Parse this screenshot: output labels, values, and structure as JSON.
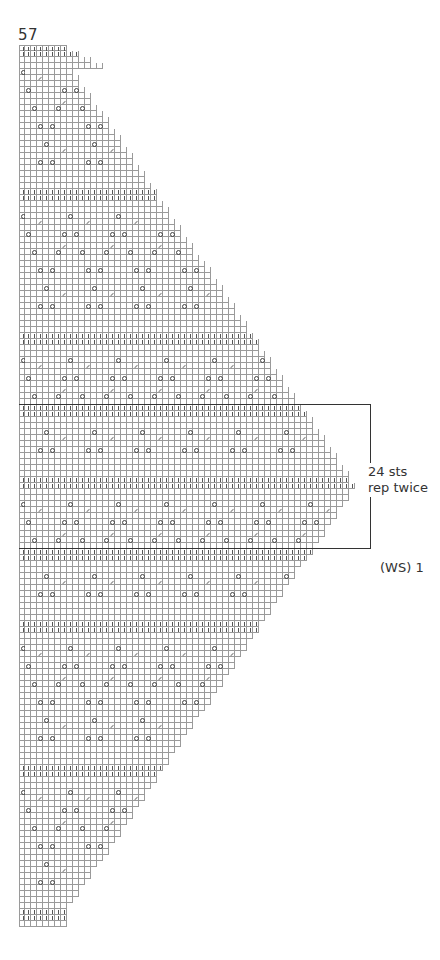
{
  "chart_number": "57",
  "repeat_label": {
    "line1": "24 sts",
    "line2": "rep twice"
  },
  "row_label": "(WS) 1",
  "legend_symbols": [
    "yo-circle-icon",
    "purl-bar-icon",
    "k2tog-slash-icon"
  ],
  "grid": {
    "cell_px": 6,
    "origin": [
      19,
      45
    ],
    "max_columns": 56,
    "total_rows": 147,
    "repeat_box": {
      "top_row": 60,
      "bottom_row": 84,
      "stitches": 24,
      "repeats": 2
    }
  },
  "chart_data": {
    "type": "table",
    "title": "57",
    "annotations": [
      "24 sts rep twice",
      "(WS) 1"
    ],
    "symbols": {
      "O": "yarn over",
      "|": "purl",
      "/": "k2tog",
      ".": "knit"
    },
    "motif_period_cols": 8,
    "purl_band_row_pairs": [
      0,
      24,
      48,
      60,
      72,
      84,
      96,
      120,
      144
    ]
  }
}
